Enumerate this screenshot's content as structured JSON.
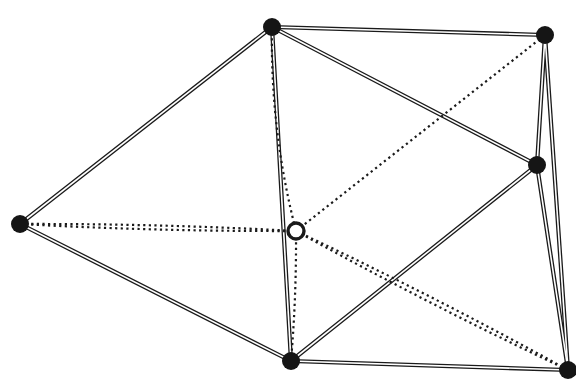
{
  "figure": {
    "background_color": "#ffffff",
    "stroke_color": "#1a1a1a",
    "width": 576,
    "height": 384
  },
  "style": {
    "solid_edge_outer_width": 4.2,
    "solid_edge_inner_width": 1.6,
    "solid_edge_inner_color": "#ffffff",
    "dotted_edge_width": 2.2,
    "dotted_dash_pattern": "2.2 3.4",
    "filled_node_radius": 9,
    "filled_node_color": "#151515",
    "hollow_node_radius": 8,
    "hollow_node_fill": "#ffffff",
    "hollow_node_stroke_width": 3.4
  },
  "nodes": [
    {
      "id": "left",
      "label": "left-vertex",
      "x": 20,
      "y": 224,
      "type": "filled"
    },
    {
      "id": "top",
      "label": "top-vertex",
      "x": 272,
      "y": 27,
      "type": "filled"
    },
    {
      "id": "top_right",
      "label": "top-right-vertex",
      "x": 545,
      "y": 35,
      "type": "filled"
    },
    {
      "id": "right_mid",
      "label": "right-middle-vertex",
      "x": 537,
      "y": 165,
      "type": "filled"
    },
    {
      "id": "bottom",
      "label": "bottom-vertex",
      "x": 291,
      "y": 361,
      "type": "filled"
    },
    {
      "id": "bottom_right",
      "label": "bottom-right-vertex",
      "x": 568,
      "y": 370,
      "type": "filled"
    },
    {
      "id": "center",
      "label": "center-vertex",
      "x": 296,
      "y": 231,
      "type": "hollow"
    }
  ],
  "edges": [
    {
      "id": "e-left-top",
      "from": "left",
      "to": "top",
      "style": "solid"
    },
    {
      "id": "e-left-bottom",
      "from": "left",
      "to": "bottom",
      "style": "solid"
    },
    {
      "id": "e-top-topright",
      "from": "top",
      "to": "top_right",
      "style": "solid"
    },
    {
      "id": "e-top-rightmid",
      "from": "top",
      "to": "right_mid",
      "style": "solid"
    },
    {
      "id": "e-top-bottom",
      "from": "top",
      "to": "bottom",
      "style": "solid"
    },
    {
      "id": "e-topright-rightmid",
      "from": "top_right",
      "to": "right_mid",
      "style": "solid"
    },
    {
      "id": "e-topright-bottomright",
      "from": "top_right",
      "to": "bottom_right",
      "style": "solid"
    },
    {
      "id": "e-rightmid-bottom",
      "from": "right_mid",
      "to": "bottom",
      "style": "solid"
    },
    {
      "id": "e-rightmid-bottomright",
      "from": "right_mid",
      "to": "bottom_right",
      "style": "solid"
    },
    {
      "id": "e-bottom-bottomright",
      "from": "bottom",
      "to": "bottom_right",
      "style": "solid"
    },
    {
      "id": "e-left-center-a",
      "from": "left",
      "to": "center",
      "style": "dotted",
      "bow": -4
    },
    {
      "id": "e-left-center-b",
      "from": "left",
      "to": "center",
      "style": "dotted",
      "bow": 4
    },
    {
      "id": "e-top-center",
      "from": "top",
      "to": "center",
      "style": "dotted",
      "bow": 14
    },
    {
      "id": "e-center-bottom",
      "from": "center",
      "to": "bottom",
      "style": "dotted",
      "bow": -3
    },
    {
      "id": "e-center-topright",
      "from": "center",
      "to": "top_right",
      "style": "dotted",
      "bow": 0
    },
    {
      "id": "e-center-bottomright-a",
      "from": "center",
      "to": "bottom_right",
      "style": "dotted",
      "bow": -5
    },
    {
      "id": "e-center-bottomright-b",
      "from": "center",
      "to": "bottom_right",
      "style": "dotted",
      "bow": 5
    }
  ]
}
